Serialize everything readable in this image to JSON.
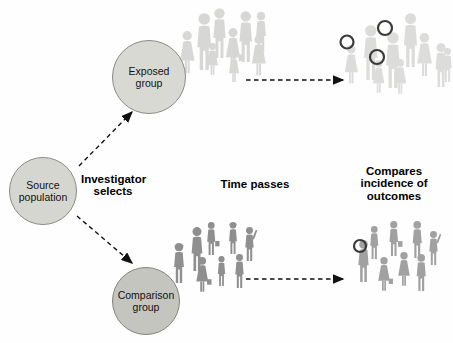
{
  "diagram": {
    "type": "cohort-study-flow",
    "nodes": [
      {
        "id": "source",
        "label": "Source\npopulation",
        "cx": 43,
        "cy": 191,
        "r": 34,
        "fill": "#d6d6d0",
        "stroke": "#8b8b85"
      },
      {
        "id": "exposed",
        "label": "Exposed\ngroup",
        "cx": 149,
        "cy": 77,
        "r": 37,
        "fill": "#d9d9d3",
        "stroke": "#8b8b85"
      },
      {
        "id": "comparison",
        "label": "Comparison\ngroup",
        "cx": 146,
        "cy": 301,
        "r": 34,
        "fill": "#c5c5bf",
        "stroke": "#83837d"
      }
    ],
    "labels": [
      {
        "id": "investigator-selects",
        "text": "Investigator\nselects"
      },
      {
        "id": "time-passes",
        "text": "Time passes"
      },
      {
        "id": "compares-outcomes",
        "text": "Compares\nincidence of\noutcomes"
      }
    ],
    "arrows": [
      {
        "name": "arrow-source-to-exposed",
        "x1": 79,
        "y1": 166,
        "x2": 132,
        "y2": 112
      },
      {
        "name": "arrow-source-to-comparison",
        "x1": 77,
        "y1": 216,
        "x2": 132,
        "y2": 263
      },
      {
        "name": "arrow-exposed-time-passes",
        "x1": 246,
        "y1": 80,
        "x2": 343,
        "y2": 80
      },
      {
        "name": "arrow-comparison-time-passes",
        "x1": 246,
        "y1": 279,
        "x2": 343,
        "y2": 279
      }
    ],
    "arrow_color": "#111111",
    "outcome_circle_color": "#3a3a3a",
    "groups": [
      {
        "name": "exposed-cohort-start",
        "color": "#d7d7d5",
        "people": [
          {
            "v": "woman",
            "x": 176,
            "y": 31,
            "h": 45
          },
          {
            "v": "man",
            "x": 190,
            "y": 13,
            "h": 57
          },
          {
            "v": "man",
            "x": 207,
            "y": 8,
            "h": 50
          },
          {
            "v": "woman",
            "x": 204,
            "y": 43,
            "h": 34
          },
          {
            "v": "woman-bag",
            "x": 222,
            "y": 28,
            "h": 44
          },
          {
            "v": "man",
            "x": 233,
            "y": 11,
            "h": 51
          },
          {
            "v": "woman",
            "x": 226,
            "y": 52,
            "h": 32
          },
          {
            "v": "woman",
            "x": 248,
            "y": 35,
            "h": 43
          },
          {
            "v": "man",
            "x": 251,
            "y": 12,
            "h": 40
          }
        ],
        "outcome_circles": []
      },
      {
        "name": "exposed-cohort-outcomes",
        "color": "#dcdcda",
        "people": [
          {
            "v": "woman",
            "x": 341,
            "y": 45,
            "h": 41
          },
          {
            "v": "man",
            "x": 357,
            "y": 25,
            "h": 55
          },
          {
            "v": "man",
            "x": 379,
            "y": 32,
            "h": 56
          },
          {
            "v": "woman",
            "x": 370,
            "y": 60,
            "h": 35
          },
          {
            "v": "man",
            "x": 397,
            "y": 13,
            "h": 54
          },
          {
            "v": "woman",
            "x": 413,
            "y": 33,
            "h": 46
          },
          {
            "v": "man",
            "x": 430,
            "y": 43,
            "h": 44
          },
          {
            "v": "woman",
            "x": 391,
            "y": 59,
            "h": 37
          },
          {
            "v": "man",
            "x": 439,
            "y": 48,
            "h": 34
          }
        ],
        "outcome_circles": [
          {
            "cx": 347,
            "cy": 42,
            "r": 6.5
          },
          {
            "cx": 385,
            "cy": 28,
            "r": 7
          },
          {
            "cx": 377,
            "cy": 57,
            "r": 7
          }
        ]
      },
      {
        "name": "comparison-cohort-start",
        "color": "#8f8f8f",
        "people": [
          {
            "v": "man-hat",
            "x": 169,
            "y": 243,
            "h": 40
          },
          {
            "v": "man",
            "x": 186,
            "y": 227,
            "h": 44
          },
          {
            "v": "man-briefcase",
            "x": 203,
            "y": 222,
            "h": 33
          },
          {
            "v": "man-hat",
            "x": 225,
            "y": 222,
            "h": 32
          },
          {
            "v": "man-wave",
            "x": 241,
            "y": 227,
            "h": 34
          },
          {
            "v": "woman-bag",
            "x": 193,
            "y": 257,
            "h": 37
          },
          {
            "v": "man",
            "x": 214,
            "y": 256,
            "h": 30
          },
          {
            "v": "man",
            "x": 231,
            "y": 254,
            "h": 34
          }
        ],
        "outcome_circles": []
      },
      {
        "name": "comparison-cohort-outcomes",
        "color": "#a1a1a1",
        "people": [
          {
            "v": "man",
            "x": 353,
            "y": 240,
            "h": 42
          },
          {
            "v": "man",
            "x": 366,
            "y": 226,
            "h": 33
          },
          {
            "v": "man-briefcase",
            "x": 385,
            "y": 221,
            "h": 35
          },
          {
            "v": "man",
            "x": 408,
            "y": 221,
            "h": 37
          },
          {
            "v": "man-wave",
            "x": 425,
            "y": 231,
            "h": 34
          },
          {
            "v": "woman-bag",
            "x": 375,
            "y": 257,
            "h": 36
          },
          {
            "v": "woman",
            "x": 395,
            "y": 252,
            "h": 36
          },
          {
            "v": "man",
            "x": 412,
            "y": 254,
            "h": 37
          }
        ],
        "outcome_circles": [
          {
            "cx": 360,
            "cy": 246,
            "r": 6
          }
        ]
      }
    ]
  }
}
